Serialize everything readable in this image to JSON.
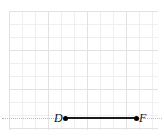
{
  "figure": {
    "type": "geometry-diagram",
    "background_color": "#ffffff",
    "grid": {
      "minor_line_color": "#efefef",
      "major_line_color": "#e2e2e2",
      "minor_spacing_px": 13,
      "major_spacing_px": 39,
      "columns": 11,
      "rows": 9
    },
    "axis": {
      "style": "dotted",
      "color": "#b9b9b9",
      "orientation": "horizontal"
    },
    "segment": {
      "name": "DF",
      "color": "#1a1a1a",
      "thickness_px": 2,
      "length_px": 71,
      "endpoint_marker": "filled-dot",
      "endpoint_marker_color": "#000000"
    },
    "points": [
      {
        "label": "D",
        "position": "left"
      },
      {
        "label": "F",
        "position": "right"
      }
    ]
  }
}
